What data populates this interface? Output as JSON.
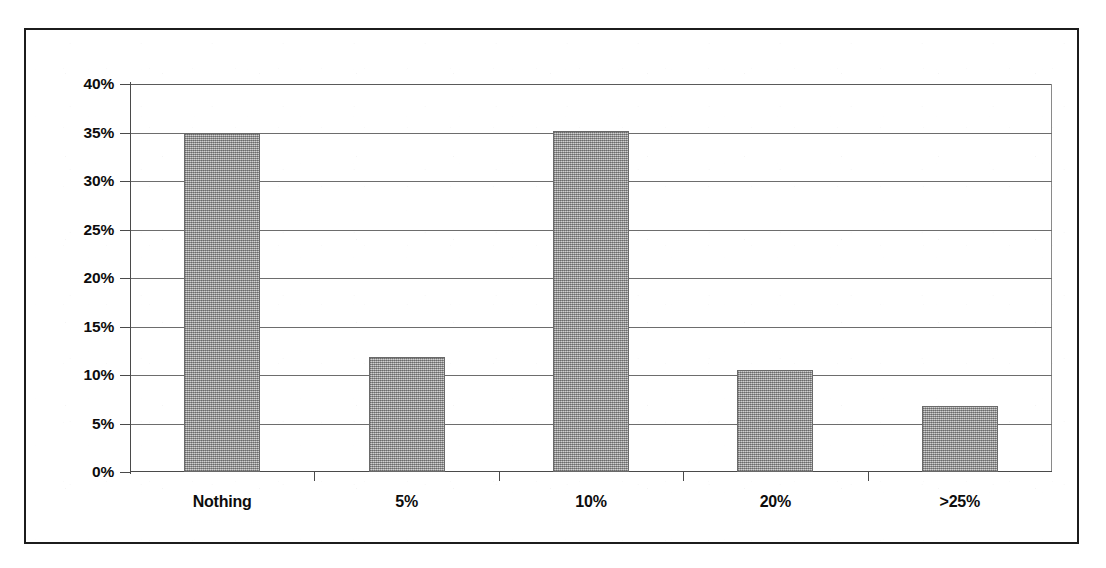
{
  "figure": {
    "frame_color": "#1c1c1c",
    "background_color": "#ffffff",
    "bar_fill_color": "#a3a3a3",
    "bar_border_color": "#6a6a6a",
    "gridline_color": "#6d6d6d",
    "axis_color": "#4a4a4a",
    "text_color": "#0d0d0d"
  },
  "chart_data": {
    "type": "bar",
    "title": "",
    "subtitle": "",
    "xlabel": "",
    "ylabel": "",
    "categories": [
      "Nothing",
      "5%",
      "10%",
      "20%",
      ">25%"
    ],
    "values": [
      35.0,
      11.9,
      35.2,
      10.5,
      6.8
    ],
    "value_labels": [
      "35.0%",
      "11.9%",
      "35.2%",
      "10.5%",
      "6.8%"
    ],
    "ylim": [
      0,
      40
    ],
    "ytick_values": [
      0,
      5,
      10,
      15,
      20,
      25,
      30,
      35,
      40
    ],
    "ytick_labels": [
      "0%",
      "5%",
      "10%",
      "15%",
      "20%",
      "25%",
      "30%",
      "35%",
      "40%"
    ],
    "grid": true,
    "grid_axis": "y",
    "legend": false,
    "legend_position": "none",
    "series": [
      {
        "name": "Share of respondents",
        "values": [
          35.0,
          11.9,
          35.2,
          10.5,
          6.8
        ]
      }
    ],
    "annotations": []
  }
}
